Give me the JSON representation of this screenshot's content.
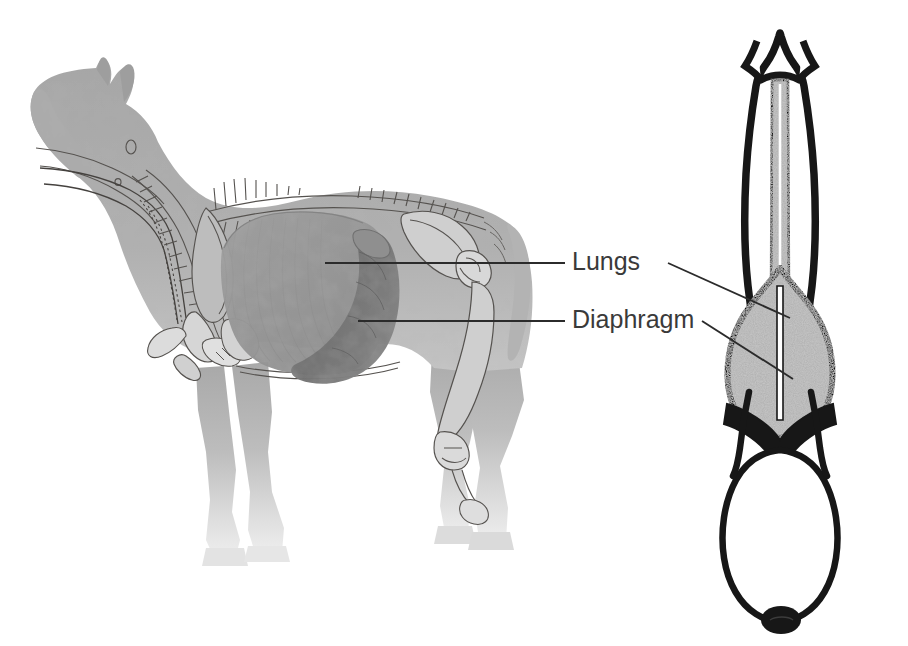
{
  "figure": {
    "background_color": "#ffffff",
    "views": [
      {
        "name": "lateral-view",
        "description": "Side view of horse with skeleton and respiratory organs"
      },
      {
        "name": "dorsal-view",
        "description": "Top-down view of horse showing lungs and diaphragm"
      }
    ]
  },
  "labels": [
    {
      "id": "lungs",
      "text": "Lungs",
      "x": 572,
      "y": 263,
      "color": "#3a3a3a",
      "leader_left": {
        "x1": 565,
        "y1": 263,
        "x2": 325,
        "y2": 263
      },
      "leader_right": {
        "x1": 668,
        "y1": 263,
        "x2": 790,
        "y2": 318
      }
    },
    {
      "id": "diaphragm",
      "text": "Diaphragm",
      "x": 572,
      "y": 321,
      "color": "#3a3a3a",
      "leader_left": {
        "x1": 565,
        "y1": 321,
        "x2": 358,
        "y2": 321
      },
      "leader_right": {
        "x1": 702,
        "y1": 321,
        "x2": 793,
        "y2": 379
      }
    }
  ],
  "colors": {
    "body_gray": "#a9a9a9",
    "body_gray_light": "#c9c9c9",
    "body_fade": "#e7e7e7",
    "lung_lateral": "#9a9a9a",
    "diaphragm_lateral": "#6f6f6f",
    "bone_outline": "#55524f",
    "outline_black": "#171717",
    "stipple_gray": "#b4b4b4",
    "leader_line": "#2b2b2b",
    "label_text": "#3a3a3a"
  },
  "lateral_view": {
    "parts": [
      {
        "name": "head",
        "label": "Head"
      },
      {
        "name": "ear",
        "label": "Ear"
      },
      {
        "name": "neck",
        "label": "Neck"
      },
      {
        "name": "trachea",
        "label": "Trachea"
      },
      {
        "name": "cervical-vertebrae",
        "label": "Cervical vertebrae"
      },
      {
        "name": "scapula",
        "label": "Scapula"
      },
      {
        "name": "ribcage",
        "label": "Ribcage"
      },
      {
        "name": "spine",
        "label": "Spine"
      },
      {
        "name": "lungs",
        "label": "Lungs"
      },
      {
        "name": "diaphragm",
        "label": "Diaphragm"
      },
      {
        "name": "heart",
        "label": "Heart"
      },
      {
        "name": "pelvis",
        "label": "Pelvis"
      },
      {
        "name": "femur",
        "label": "Femur"
      },
      {
        "name": "foreleg",
        "label": "Foreleg"
      },
      {
        "name": "hindleg",
        "label": "Hindleg"
      },
      {
        "name": "hoof",
        "label": "Hoof"
      },
      {
        "name": "tail",
        "label": "Tail"
      }
    ]
  },
  "dorsal_view": {
    "parts": [
      {
        "name": "head",
        "label": "Head"
      },
      {
        "name": "ear-left",
        "label": "Left ear"
      },
      {
        "name": "ear-right",
        "label": "Right ear"
      },
      {
        "name": "neck",
        "label": "Neck"
      },
      {
        "name": "trachea",
        "label": "Trachea"
      },
      {
        "name": "lung-left",
        "label": "Left lung"
      },
      {
        "name": "lung-right",
        "label": "Right lung"
      },
      {
        "name": "mediastinum",
        "label": "Mediastinum"
      },
      {
        "name": "diaphragm",
        "label": "Diaphragm"
      },
      {
        "name": "abdomen",
        "label": "Abdomen"
      },
      {
        "name": "tail-base",
        "label": "Tail base"
      }
    ]
  }
}
